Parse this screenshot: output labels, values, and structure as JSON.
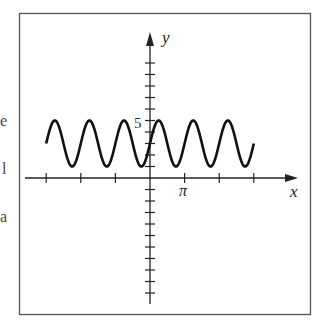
{
  "side_fragments": [
    {
      "text": "e",
      "x": 0,
      "y": 112
    },
    {
      "text": "l",
      "x": 2,
      "y": 160
    },
    {
      "text": "a",
      "x": 0,
      "y": 208
    }
  ],
  "chart_data": {
    "type": "line",
    "title": "",
    "function": "y = 3 + 2 sin 2x",
    "xlabel": "x",
    "ylabel": "y",
    "x_tick_labels": [
      {
        "value": "π",
        "at": 3.14159
      }
    ],
    "y_tick_labels": [
      {
        "value": "5",
        "at": 5
      }
    ],
    "x_ticks": [
      -9.42478,
      -6.28319,
      -3.14159,
      3.14159,
      6.28319,
      9.42478
    ],
    "y_ticks": [
      -10,
      -9,
      -8,
      -7,
      -6,
      -5,
      -4,
      -3,
      -2,
      -1,
      1,
      2,
      3,
      4,
      5,
      6,
      7,
      8,
      9,
      10
    ],
    "xlim": [
      -9.42478,
      9.42478
    ],
    "ylim": [
      -11,
      11
    ],
    "amplitude": 2,
    "midline": 3,
    "period": 3.14159,
    "max": 5,
    "min": 1,
    "grid": false,
    "legend": null,
    "sample_points": [
      {
        "x": -9.42478,
        "y": 3
      },
      {
        "x": -8.63938,
        "y": 5
      },
      {
        "x": -7.06858,
        "y": 1
      },
      {
        "x": -5.49779,
        "y": 5
      },
      {
        "x": -3.92699,
        "y": 1
      },
      {
        "x": -2.35619,
        "y": 5
      },
      {
        "x": -0.7854,
        "y": 1
      },
      {
        "x": 0,
        "y": 3
      },
      {
        "x": 0.7854,
        "y": 5
      },
      {
        "x": 2.35619,
        "y": 1
      },
      {
        "x": 3.92699,
        "y": 5
      },
      {
        "x": 5.49779,
        "y": 1
      },
      {
        "x": 7.06858,
        "y": 5
      },
      {
        "x": 8.63938,
        "y": 1
      },
      {
        "x": 9.42478,
        "y": 3
      }
    ]
  }
}
